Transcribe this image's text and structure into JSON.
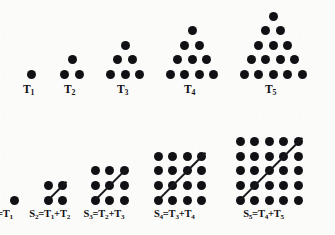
{
  "figure": {
    "dot_color": "#111014",
    "line_color": "#17161a",
    "background_color": "#fbfbfa",
    "dot_diameter_px": 9
  },
  "chart_data": {
    "type": "diagram",
    "xlabel": "",
    "ylabel": "",
    "grid": false,
    "legend": null,
    "triangular_numbers": {
      "row_label": "top",
      "description": "Staircase triangles: row k of T_n contains k dots, apex at top",
      "items": [
        {
          "label": "T",
          "index": "1",
          "caption": "T1",
          "rows": 1,
          "dot_count": 1,
          "row_counts": [
            1
          ]
        },
        {
          "label": "T",
          "index": "2",
          "caption": "T2",
          "rows": 2,
          "dot_count": 3,
          "row_counts": [
            1,
            2
          ]
        },
        {
          "label": "T",
          "index": "3",
          "caption": "T3",
          "rows": 3,
          "dot_count": 6,
          "row_counts": [
            1,
            2,
            3
          ]
        },
        {
          "label": "T",
          "index": "4",
          "caption": "T4",
          "rows": 4,
          "dot_count": 10,
          "row_counts": [
            1,
            2,
            3,
            4
          ]
        },
        {
          "label": "T",
          "index": "5",
          "caption": "T5",
          "rows": 5,
          "dot_count": 15,
          "row_counts": [
            1,
            2,
            3,
            4,
            5
          ]
        }
      ]
    },
    "square_numbers": {
      "row_label": "bottom",
      "description": "n by n square arrays divided by a diagonal from the bottom-left dot to the top-right dot, showing S_n = T_(n-1) + T_n",
      "items": [
        {
          "label": "S",
          "index": "1",
          "size": 1,
          "dot_count": 1,
          "equation": "S1 = T1",
          "equation_parts": [
            "S",
            "1",
            "=",
            "T",
            "1"
          ],
          "has_diagonal": false
        },
        {
          "label": "S",
          "index": "2",
          "size": 2,
          "dot_count": 4,
          "equation": "S2 = T1 + T2",
          "equation_parts": [
            "S",
            "2",
            "=",
            "T",
            "1",
            "+",
            "T",
            "2"
          ],
          "has_diagonal": true
        },
        {
          "label": "S",
          "index": "3",
          "size": 3,
          "dot_count": 9,
          "equation": "S3 = T2 + T3",
          "equation_parts": [
            "S",
            "3",
            "=",
            "T",
            "2",
            "+",
            "T",
            "3"
          ],
          "has_diagonal": true
        },
        {
          "label": "S",
          "index": "4",
          "size": 4,
          "dot_count": 16,
          "equation": "S4 = T3 + T4",
          "equation_parts": [
            "S",
            "4",
            "=",
            "T",
            "3",
            "+",
            "T",
            "4"
          ],
          "has_diagonal": true
        },
        {
          "label": "S",
          "index": "5",
          "size": 5,
          "dot_count": 25,
          "equation": "S5 = T4 + T5",
          "equation_parts": [
            "S",
            "5",
            "=",
            "T",
            "4",
            "+",
            "T",
            "5"
          ],
          "has_diagonal": true
        }
      ]
    }
  },
  "captions": {
    "top": [
      {
        "base": "T",
        "sub": "1"
      },
      {
        "base": "T",
        "sub": "2"
      },
      {
        "base": "T",
        "sub": "3"
      },
      {
        "base": "T",
        "sub": "4"
      },
      {
        "base": "T",
        "sub": "5"
      }
    ],
    "bottom": [
      {
        "lhs_base": "S",
        "lhs_sub": "1",
        "eq": "=",
        "rhs": "T",
        "rhs_sub": "1",
        "plus": "",
        "rhs2": "",
        "rhs2_sub": ""
      },
      {
        "lhs_base": "S",
        "lhs_sub": "2",
        "eq": "=",
        "rhs": "T",
        "rhs_sub": "1",
        "plus": "+",
        "rhs2": "T",
        "rhs2_sub": "2"
      },
      {
        "lhs_base": "S",
        "lhs_sub": "3",
        "eq": "=",
        "rhs": "T",
        "rhs_sub": "2",
        "plus": "+",
        "rhs2": "T",
        "rhs2_sub": "3"
      },
      {
        "lhs_base": "S",
        "lhs_sub": "4",
        "eq": "=",
        "rhs": "T",
        "rhs_sub": "3",
        "plus": "+",
        "rhs2": "T",
        "rhs2_sub": "4"
      },
      {
        "lhs_base": "S",
        "lhs_sub": "5",
        "eq": "=",
        "rhs": "T",
        "rhs_sub": "4",
        "plus": "+",
        "rhs2": "T",
        "rhs2_sub": "5"
      }
    ]
  }
}
